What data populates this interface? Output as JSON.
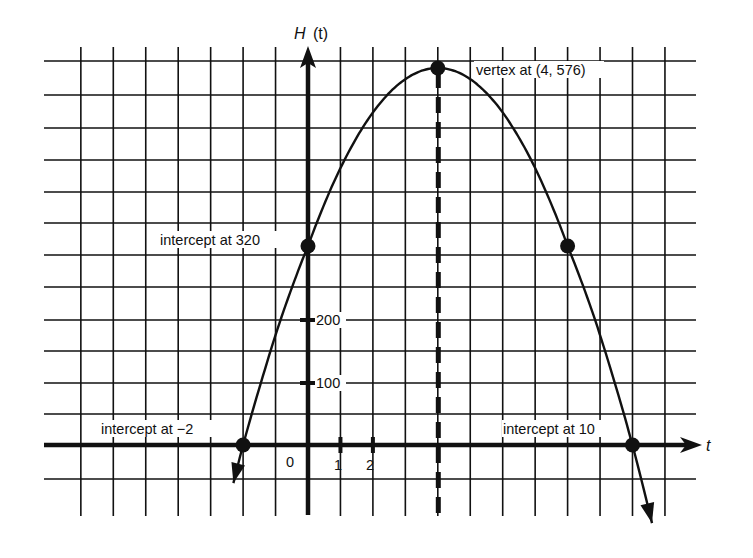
{
  "chart_data": {
    "type": "line",
    "title": "",
    "xlabel": "t",
    "ylabel": "H (t)",
    "ylabel_italic_part": "H",
    "ylabel_rest": "(t)",
    "function": "H(t) = -16(t + 2)(t - 10)",
    "x_range": [
      -8,
      11
    ],
    "y_range": [
      -50,
      600
    ],
    "grid": true,
    "x_grid_step": 1,
    "y_grid_step": 50,
    "x_tick_labels": [
      {
        "value": 0,
        "label": "0"
      },
      {
        "value": 1,
        "label": "1"
      },
      {
        "value": 2,
        "label": "2"
      }
    ],
    "y_tick_labels": [
      {
        "value": 100,
        "label": "100"
      },
      {
        "value": 200,
        "label": "200"
      }
    ],
    "series": [
      {
        "name": "H(t)",
        "x": [
          -2.3,
          -2,
          -1,
          0,
          1,
          2,
          3,
          4,
          5,
          6,
          7,
          8,
          9,
          10,
          10.6
        ],
        "y": [
          -110,
          0,
          176,
          320,
          432,
          512,
          560,
          576,
          560,
          512,
          432,
          320,
          176,
          0,
          -110
        ]
      }
    ],
    "marked_points": [
      {
        "x": -2,
        "y": 0,
        "label": "intercept at −2"
      },
      {
        "x": 0,
        "y": 320,
        "label": "intercept at 320"
      },
      {
        "x": 4,
        "y": 576,
        "label": "vertex at (4, 576)"
      },
      {
        "x": 8,
        "y": 320,
        "label": ""
      },
      {
        "x": 10,
        "y": 0,
        "label": "intercept at 10"
      }
    ],
    "axis_of_symmetry": {
      "x": 4,
      "style": "dashed"
    }
  },
  "annotations": {
    "left_intercept": "intercept at −2",
    "y_intercept": "intercept at 320",
    "vertex": "vertex at (4, 576)",
    "right_intercept": "intercept at 10"
  },
  "colors": {
    "ink": "#111111",
    "background": "#ffffff"
  }
}
